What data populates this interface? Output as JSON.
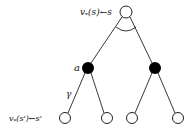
{
  "diagram": {
    "type": "backup-tree",
    "root": {
      "label": "v*(s) ← s",
      "label_parts": {
        "fn": "v",
        "sub": "*",
        "arg": "(s)",
        "arrow": "←",
        "state": "s"
      },
      "fill": "white",
      "x": 126,
      "y": 12
    },
    "max_arc": {
      "meaning": "max over actions"
    },
    "action_nodes": [
      {
        "label": "a",
        "fill": "black",
        "x": 88,
        "y": 68
      },
      {
        "label": "",
        "fill": "black",
        "x": 155,
        "y": 68
      }
    ],
    "leaf_nodes": [
      {
        "label": "v*(s') ← s'",
        "label_parts": {
          "fn": "v",
          "sub": "*",
          "arg": "(s')",
          "arrow": "←",
          "state": "s'"
        },
        "fill": "white",
        "x": 65,
        "y": 118
      },
      {
        "label": "",
        "fill": "white",
        "x": 107,
        "y": 118
      },
      {
        "label": "",
        "fill": "white",
        "x": 132,
        "y": 118
      },
      {
        "label": "",
        "fill": "white",
        "x": 178,
        "y": 118
      }
    ],
    "edge_labels": {
      "discount": "γ",
      "action": "a"
    },
    "colors": {
      "stroke": "#222222",
      "filled": "#000000",
      "empty": "#ffffff"
    }
  }
}
